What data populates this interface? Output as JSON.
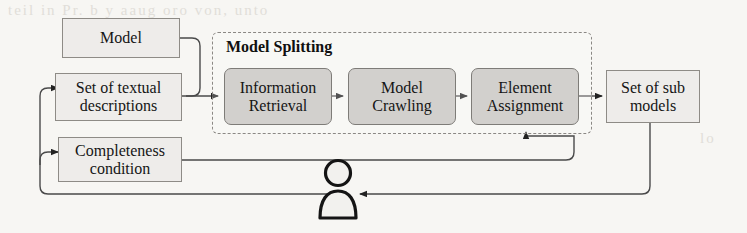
{
  "figure": {
    "width": 747,
    "height": 233,
    "background_color": "#f7f6f3",
    "ink_color": "#151515",
    "process_fill": "#d2d0cd",
    "data_fill": "#eeecea",
    "border_color": "#8e8b86"
  },
  "container": {
    "title": "Model Splitting",
    "style": "dashed"
  },
  "nodes": {
    "model": {
      "label": "Model",
      "type": "data"
    },
    "textual_descriptions": {
      "label": "Set of textual\ndescriptions",
      "line1": "Set of textual",
      "line2": "descriptions",
      "type": "data-stack"
    },
    "completeness_condition": {
      "label": "Completeness\ncondition",
      "line1": "Completeness",
      "line2": "condition",
      "type": "data"
    },
    "information_retrieval": {
      "label": "Information\nRetrieval",
      "line1": "Information",
      "line2": "Retrieval",
      "type": "process"
    },
    "model_crawling": {
      "label": "Model\nCrawling",
      "line1": "Model",
      "line2": "Crawling",
      "type": "process"
    },
    "element_assignment": {
      "label": "Element\nAssignment",
      "line1": "Element",
      "line2": "Assignment",
      "type": "process"
    },
    "sub_models": {
      "label": "Set of sub\nmodels",
      "line1": "Set of sub",
      "line2": "models",
      "type": "data-stack"
    },
    "user": {
      "label": "user-actor",
      "type": "actor-icon"
    }
  },
  "background_text": {
    "line_top": "teil in Pr. b y  aaug oro von, unto",
    "line_mid_left": "wt of",
    "line_right_1": "h",
    "line_right_2": "lo"
  }
}
